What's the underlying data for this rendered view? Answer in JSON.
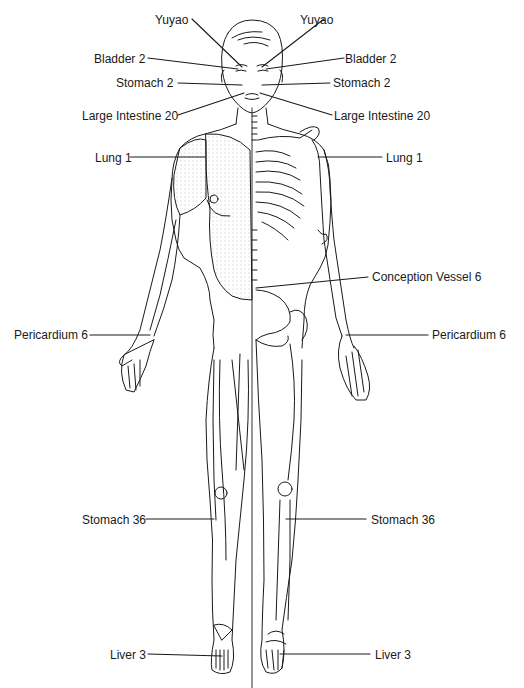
{
  "diagram": {
    "type": "anatomical-acupuncture-points",
    "line_color": "#1a1a1a",
    "background": "#ffffff"
  },
  "labels": {
    "left": [
      {
        "id": "yuyao-left",
        "text": "Yuyao",
        "x": 155,
        "y": 13
      },
      {
        "id": "bladder2-left",
        "text": "Bladder 2",
        "x": 94,
        "y": 52
      },
      {
        "id": "stomach2-left",
        "text": "Stomach 2",
        "x": 116,
        "y": 76
      },
      {
        "id": "large-intestine20-left",
        "text": "Large Intestine 20",
        "x": 82,
        "y": 109
      },
      {
        "id": "lung1-left",
        "text": "Lung 1",
        "x": 95,
        "y": 151
      },
      {
        "id": "pericardium6-left",
        "text": "Pericardium 6",
        "x": 14,
        "y": 328
      },
      {
        "id": "stomach36-left",
        "text": "Stomach 36",
        "x": 82,
        "y": 513
      },
      {
        "id": "liver3-left",
        "text": "Liver 3",
        "x": 110,
        "y": 648
      }
    ],
    "right": [
      {
        "id": "yuyao-right",
        "text": "Yuyao",
        "x": 300,
        "y": 13
      },
      {
        "id": "bladder2-right",
        "text": "Bladder 2",
        "x": 345,
        "y": 52
      },
      {
        "id": "stomach2-right",
        "text": "Stomach 2",
        "x": 333,
        "y": 76
      },
      {
        "id": "large-intestine20-right",
        "text": "Large Intestine 20",
        "x": 334,
        "y": 109
      },
      {
        "id": "lung1-right",
        "text": "Lung 1",
        "x": 386,
        "y": 151
      },
      {
        "id": "conception-vessel6",
        "text": "Conception Vessel 6",
        "x": 372,
        "y": 270
      },
      {
        "id": "pericardium6-right",
        "text": "Pericardium 6",
        "x": 432,
        "y": 328
      },
      {
        "id": "stomach36-right",
        "text": "Stomach 36",
        "x": 371,
        "y": 513
      },
      {
        "id": "liver3-right",
        "text": "Liver 3",
        "x": 375,
        "y": 648
      }
    ]
  }
}
